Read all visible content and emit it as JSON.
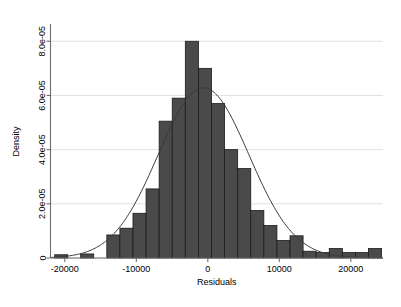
{
  "chart_data": {
    "type": "bar",
    "title": "",
    "subtitle": "",
    "xlabel": "Residuals",
    "ylabel": "Density",
    "xlim": [
      -22000,
      24500
    ],
    "ylim": [
      0,
      8.6e-05
    ],
    "grid": true,
    "legend": false,
    "legend_position": "none",
    "x_tick_labels": [
      "-20000",
      "-10000",
      "0",
      "10000",
      "20000"
    ],
    "x_tick_values": [
      -20000,
      -10000,
      0,
      10000,
      20000
    ],
    "y_tick_labels": [
      "0",
      "2.0e-05",
      "4.0e-05",
      "6.0e-05",
      "8.0e-05"
    ],
    "y_tick_values": [
      0,
      2e-05,
      4e-05,
      6e-05,
      8e-05
    ],
    "bin_width": 1830,
    "bar_color": "#4a4a4a",
    "bar_edge_color": "#1b1b1b",
    "curve_color": "#3a3a3a",
    "bin_centers": [
      -20500,
      -18700,
      -16870,
      -15040,
      -13210,
      -11380,
      -9550,
      -7720,
      -5890,
      -4060,
      -2230,
      -400,
      1430,
      3260,
      5090,
      6920,
      8750,
      10580,
      12410,
      14240,
      16070,
      17900,
      19730,
      21560,
      23390
    ],
    "values": [
      1.2e-06,
      0.0,
      1.5e-06,
      0.0,
      8.5e-06,
      1.1e-05,
      1.65e-05,
      2.55e-05,
      5.05e-05,
      5.9e-05,
      8e-05,
      7e-05,
      5.7e-05,
      4e-05,
      3.3e-05,
      1.75e-05,
      1.2e-05,
      6.5e-06,
      8.2e-06,
      2.5e-06,
      2e-06,
      3.5e-06,
      2e-06,
      2e-06,
      3.5e-06
    ],
    "series": [
      {
        "name": "Density",
        "type": "line",
        "description": "normal density overlay",
        "mean": -600,
        "sd": 6350,
        "peak": 6.28e-05
      }
    ]
  },
  "figure": {
    "background_color": "#ffffff",
    "plot_background_color": "#ffffff",
    "axis_color": "#6e6e6e",
    "grid_color": "#d9d9d9"
  }
}
